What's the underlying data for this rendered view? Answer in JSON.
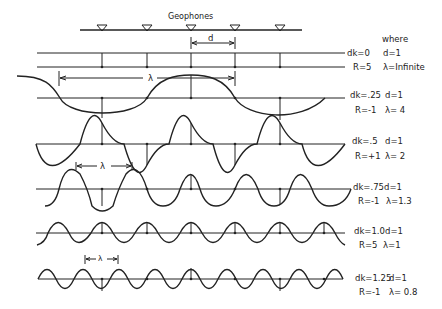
{
  "figure": {
    "geophones_label": "Geophones",
    "where_label": "where",
    "spacing_label": "d",
    "lambda_symbol": "λ",
    "geophone_x": [
      102,
      147,
      191,
      235,
      280
    ],
    "line_color": "#222222"
  },
  "rows": [
    {
      "dk": "dk=0",
      "d": "d=1",
      "R": "R=5",
      "lambda": "λ=Infinite"
    },
    {
      "dk": "dk=.25",
      "d": "d=1",
      "R": "R=-1",
      "lambda": "λ= 4"
    },
    {
      "dk": "dk=.5",
      "d": "d=1",
      "R": "R=+1",
      "lambda": "λ= 2"
    },
    {
      "dk": "dk=.75",
      "d": "d=1",
      "R": "R=-1",
      "lambda": "λ=1.3"
    },
    {
      "dk": "dk=1.0",
      "d": "d=1",
      "R": "R=5",
      "lambda": "λ=1"
    },
    {
      "dk": "dk=1.25",
      "d": "d=1",
      "R": "R=-1",
      "lambda": "λ= 0.8"
    }
  ]
}
